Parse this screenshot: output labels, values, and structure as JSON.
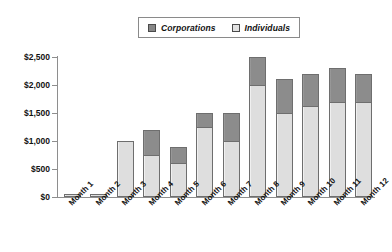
{
  "chart_data": {
    "type": "bar",
    "subtype": "stacked-bar",
    "title": "",
    "subtitle": "",
    "xlabel": "",
    "ylabel": "",
    "categories": [
      "Month 1",
      "Month 2",
      "Month 3",
      "Month 4",
      "Month 5",
      "Month 6",
      "Month 7",
      "Month 8",
      "Month 9",
      "Month 10",
      "Month 11",
      "Month 12"
    ],
    "series": [
      {
        "name": "Individuals",
        "color": "#dedede",
        "values": [
          50,
          50,
          1000,
          750,
          600,
          1250,
          1000,
          2000,
          1500,
          1620,
          1700,
          1700
        ]
      },
      {
        "name": "Corporations",
        "color": "#8c8c8c",
        "values": [
          0,
          0,
          0,
          450,
          300,
          250,
          500,
          500,
          600,
          580,
          600,
          500
        ]
      }
    ],
    "totals": [
      50,
      50,
      1000,
      1200,
      900,
      1500,
      1500,
      2500,
      2100,
      2200,
      2300,
      2200
    ],
    "ylim": [
      0,
      2500
    ],
    "ytick_values": [
      0,
      500,
      1000,
      1500,
      2000,
      2500
    ],
    "ytick_labels": [
      "$0",
      "$500",
      "$1,000",
      "$1,500",
      "$2,000",
      "$2,500"
    ],
    "grid": false,
    "legend_position": "top-center",
    "stack_order": [
      "Individuals",
      "Corporations"
    ],
    "currency_prefix": "$"
  },
  "legend": {
    "entries": [
      {
        "label": "Corporations",
        "swatch": "corporations-swatch"
      },
      {
        "label": "Individuals",
        "swatch": "individuals-swatch"
      }
    ]
  },
  "colors": {
    "corporations": "#8c8c8c",
    "individuals": "#dedede",
    "axis": "#8e8e8e",
    "text": "#111111",
    "background": "#ffffff",
    "bar_border": "#6e6e6e"
  }
}
